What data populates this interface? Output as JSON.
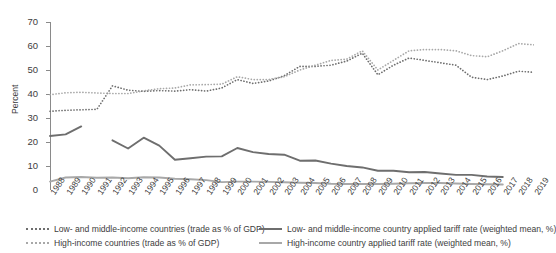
{
  "axis": {
    "ylabel": "Percent",
    "yticks": [
      "0",
      "10",
      "20",
      "30",
      "40",
      "50",
      "60",
      "70"
    ],
    "ylim": [
      0,
      70
    ],
    "xticks": [
      "1988",
      "1989",
      "1990",
      "1991",
      "1992",
      "1993",
      "1994",
      "1995",
      "1996",
      "1997",
      "1998",
      "1999",
      "2000",
      "2001",
      "2002",
      "2003",
      "2004",
      "2005",
      "2006",
      "2007",
      "2008",
      "2009",
      "2010",
      "2011",
      "2012",
      "2013",
      "2014",
      "2015",
      "2016",
      "2017",
      "2018",
      "2019"
    ]
  },
  "legend": {
    "items": [
      {
        "label": "Low- and middle-income countries (trade as % of GDP)",
        "style": "dotted",
        "color": "#6e6e6e",
        "col": 0,
        "row": 0
      },
      {
        "label": "High-income countries (trade as % of GDP)",
        "style": "dotted",
        "color": "#a8a8a8",
        "col": 0,
        "row": 1
      },
      {
        "label": "Low- and middle-income country applied tariff rate (weighted mean, %)",
        "style": "solid",
        "color": "#6e6e6e",
        "col": 1,
        "row": 0
      },
      {
        "label": "High-income country applied tariff rate (weighted mean, %)",
        "style": "solid",
        "color": "#a8a8a8",
        "col": 1,
        "row": 1
      }
    ]
  },
  "colors": {
    "dark_gray": "#6e6e6e",
    "light_gray": "#a8a8a8",
    "axis": "#8a8a8a",
    "text": "#3d3d3d",
    "background": "#ffffff"
  },
  "chart_data": {
    "type": "line",
    "title": "",
    "xlabel": "",
    "ylabel": "Percent",
    "ylim": [
      0,
      70
    ],
    "grid": false,
    "legend_position": "bottom",
    "x": [
      1988,
      1989,
      1990,
      1991,
      1992,
      1993,
      1994,
      1995,
      1996,
      1997,
      1998,
      1999,
      2000,
      2001,
      2002,
      2003,
      2004,
      2005,
      2006,
      2007,
      2008,
      2009,
      2010,
      2011,
      2012,
      2013,
      2014,
      2015,
      2016,
      2017,
      2018,
      2019
    ],
    "series": [
      {
        "name": "Low- and middle-income countries (trade as % of GDP)",
        "style": "dotted",
        "color": "#6e6e6e",
        "values": [
          32.8,
          33.2,
          33.4,
          33.6,
          43.4,
          41.6,
          41.1,
          41.4,
          41.2,
          41.8,
          41.2,
          42.5,
          46.0,
          44.4,
          45.4,
          47.6,
          51.5,
          51.5,
          52.0,
          53.7,
          57.0,
          48.0,
          52.0,
          55.0,
          54.0,
          53.0,
          52.0,
          47.0,
          46.0,
          47.5,
          49.5,
          49.0
        ]
      },
      {
        "name": "High-income countries (trade as % of GDP)",
        "style": "dotted",
        "color": "#a8a8a8",
        "values": [
          39.7,
          40.5,
          40.7,
          40.4,
          40.2,
          40.2,
          41.3,
          42.2,
          42.5,
          43.8,
          43.9,
          44.1,
          47.2,
          46.0,
          46.0,
          47.2,
          50.0,
          52.0,
          54.0,
          54.5,
          58.0,
          50.0,
          54.0,
          58.0,
          58.5,
          58.5,
          58.0,
          56.0,
          55.5,
          58.0,
          61.0,
          60.5
        ]
      },
      {
        "name": "Low- and middle-income country applied tariff rate (weighted mean, %)",
        "style": "solid",
        "color": "#6e6e6e",
        "values": [
          22.5,
          23.2,
          26.5,
          null,
          20.7,
          17.3,
          21.8,
          18.5,
          12.6,
          13.2,
          13.9,
          14.0,
          17.5,
          15.8,
          15.0,
          14.7,
          12.2,
          12.3,
          11.0,
          10.0,
          9.4,
          8.0,
          8.0,
          7.4,
          7.5,
          6.9,
          6.3,
          6.3,
          5.6,
          5.4,
          null,
          null
        ]
      },
      {
        "name": "High-income country applied tariff rate (weighted mean, %)",
        "style": "solid",
        "color": "#a8a8a8",
        "values": [
          3.5,
          5.2,
          5.4,
          5.1,
          5.2,
          4.9,
          5.3,
          5.2,
          4.7,
          4.5,
          4.1,
          3.3,
          3.5,
          3.5,
          3.4,
          3.2,
          3.0,
          2.9,
          2.6,
          2.5,
          2.5,
          2.5,
          2.6,
          2.8,
          2.9,
          2.9,
          2.7,
          2.5,
          2.4,
          2.3,
          null,
          null
        ]
      }
    ]
  }
}
